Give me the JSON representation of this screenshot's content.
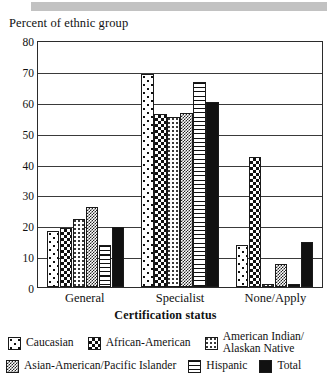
{
  "header": {
    "band_color": "#c2c2c2"
  },
  "chart_data": {
    "type": "bar",
    "title": "",
    "ylabel": "Percent of ethnic group",
    "xlabel": "Certification status",
    "categories": [
      "General",
      "Specialist",
      "None/Apply"
    ],
    "ylim": [
      0,
      80
    ],
    "ytick_step": 10,
    "yticks": [
      "0",
      "10",
      "20",
      "30",
      "40",
      "50",
      "60",
      "70",
      "80"
    ],
    "grid": true,
    "legend_position": "bottom",
    "series": [
      {
        "name": "Caucasian",
        "pattern": "white-with-large-dots",
        "values": [
          18,
          69,
          13.5
        ]
      },
      {
        "name": "African-American",
        "pattern": "black-white-checkerboard",
        "values": [
          19,
          56,
          42
        ]
      },
      {
        "name": "American Indian/\nAlaskan Native",
        "label_line1": "American Indian/",
        "label_line2": "Alaskan Native",
        "pattern": "light-fine-dots",
        "values": [
          22,
          55,
          1
        ]
      },
      {
        "name": "Asian-American/Pacific Islander",
        "pattern": "dense-fine-checker",
        "values": [
          26,
          56.5,
          7.5
        ]
      },
      {
        "name": "Hispanic",
        "pattern": "horizontal-stripes",
        "values": [
          13.5,
          66.5,
          1
        ]
      },
      {
        "name": "Total",
        "pattern": "solid-black",
        "values": [
          19.5,
          60,
          14.5
        ]
      }
    ]
  },
  "legend": {
    "row1": [
      {
        "label": "Caucasian"
      },
      {
        "label": "African-American"
      },
      {
        "label_line1": "American Indian/",
        "label_line2": "Alaskan Native"
      }
    ],
    "row2": [
      {
        "label": "Asian-American/Pacific Islander"
      },
      {
        "label": "Hispanic"
      },
      {
        "label": "Total"
      }
    ]
  }
}
